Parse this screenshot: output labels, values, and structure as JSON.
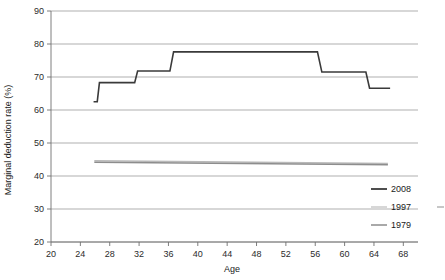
{
  "chart_data": {
    "type": "line",
    "title": "",
    "xlabel": "Age",
    "ylabel": "Marginal deduction rate (%)",
    "xlim": [
      20,
      70
    ],
    "ylim": [
      20,
      90
    ],
    "xticks": [
      20,
      24,
      28,
      32,
      36,
      40,
      44,
      48,
      52,
      56,
      60,
      64,
      68
    ],
    "yticks": [
      20,
      30,
      40,
      50,
      60,
      70,
      80,
      90
    ],
    "grid": "horizontal",
    "legend_position": "bottom-right",
    "series": [
      {
        "name": "2008",
        "color": "#3a3a3a",
        "width": 1.6,
        "points": [
          [
            25.8,
            62.5
          ],
          [
            26.3,
            62.5
          ],
          [
            26.6,
            68.3
          ],
          [
            31.4,
            68.3
          ],
          [
            31.8,
            71.8
          ],
          [
            36.2,
            71.8
          ],
          [
            36.7,
            77.6
          ],
          [
            56.3,
            77.6
          ],
          [
            56.9,
            71.5
          ],
          [
            62.9,
            71.5
          ],
          [
            63.4,
            66.6
          ],
          [
            66.2,
            66.6
          ]
        ]
      },
      {
        "name": "1997",
        "color": "#b9b9b9",
        "width": 1.5,
        "points": [
          [
            25.9,
            44.6
          ],
          [
            65.9,
            43.8
          ]
        ]
      },
      {
        "name": "1979",
        "color": "#8d8d8d",
        "width": 1.5,
        "points": [
          [
            25.9,
            44.2
          ],
          [
            65.9,
            43.4
          ]
        ]
      }
    ],
    "legend": [
      {
        "label": "2008",
        "color": "#3a3a3a",
        "width": 1.8
      },
      {
        "label": "1997",
        "color": "#c2c2c2",
        "width": 1.3
      },
      {
        "label": "1979",
        "color": "#8d8d8d",
        "width": 1.5
      }
    ]
  },
  "axes": {
    "x_title": "Age",
    "y_title": "Marginal deduction rate (%)"
  }
}
